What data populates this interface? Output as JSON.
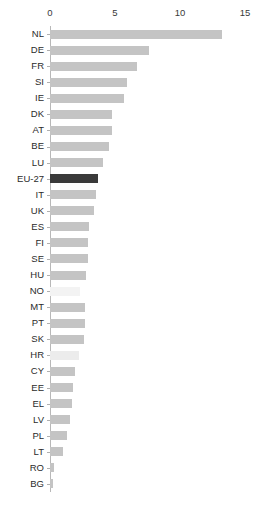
{
  "chart_data": {
    "type": "bar",
    "orientation": "horizontal",
    "title": "",
    "subtitle": "",
    "xlabel": "",
    "ylabel": "",
    "xlim": [
      0,
      15
    ],
    "ylim": null,
    "grid": false,
    "legend": null,
    "tick_labels": [
      "0",
      "5",
      "10",
      "15"
    ],
    "tick_values": [
      0,
      5,
      10,
      15
    ],
    "categories": [
      "NL",
      "DE",
      "FR",
      "SI",
      "IE",
      "DK",
      "AT",
      "BE",
      "LU",
      "EU-27",
      "IT",
      "UK",
      "ES",
      "FI",
      "SE",
      "HU",
      "NO",
      "MT",
      "PT",
      "SK",
      "HR",
      "CY",
      "EE",
      "EL",
      "LV",
      "PL",
      "LT",
      "RO",
      "BG"
    ],
    "values": [
      13.2,
      7.6,
      6.7,
      5.9,
      5.7,
      4.8,
      4.8,
      4.5,
      4.1,
      3.7,
      3.5,
      3.4,
      3.0,
      2.9,
      2.9,
      2.8,
      2.3,
      2.7,
      2.7,
      2.6,
      2.2,
      1.9,
      1.8,
      1.7,
      1.5,
      1.3,
      1.0,
      0.3,
      0.2
    ],
    "bar_colors": [
      "#c4c4c4",
      "#c4c4c4",
      "#c4c4c4",
      "#c4c4c4",
      "#c4c4c4",
      "#c4c4c4",
      "#c4c4c4",
      "#c4c4c4",
      "#c4c4c4",
      "#3a3a3a",
      "#c4c4c4",
      "#c4c4c4",
      "#c4c4c4",
      "#c4c4c4",
      "#c4c4c4",
      "#c4c4c4",
      "#f3f3f3",
      "#c4c4c4",
      "#c4c4c4",
      "#c4c4c4",
      "#ececec",
      "#c4c4c4",
      "#c4c4c4",
      "#c4c4c4",
      "#c4c4c4",
      "#c4c4c4",
      "#c4c4c4",
      "#c4c4c4",
      "#c4c4c4"
    ],
    "highlight_category": "EU-27",
    "highlight_color": "#3a3a3a",
    "default_bar_color": "#c4c4c4",
    "background_color": "#ffffff",
    "axis_color": "#b8b8b8",
    "label_color": "#2b2b2b"
  }
}
